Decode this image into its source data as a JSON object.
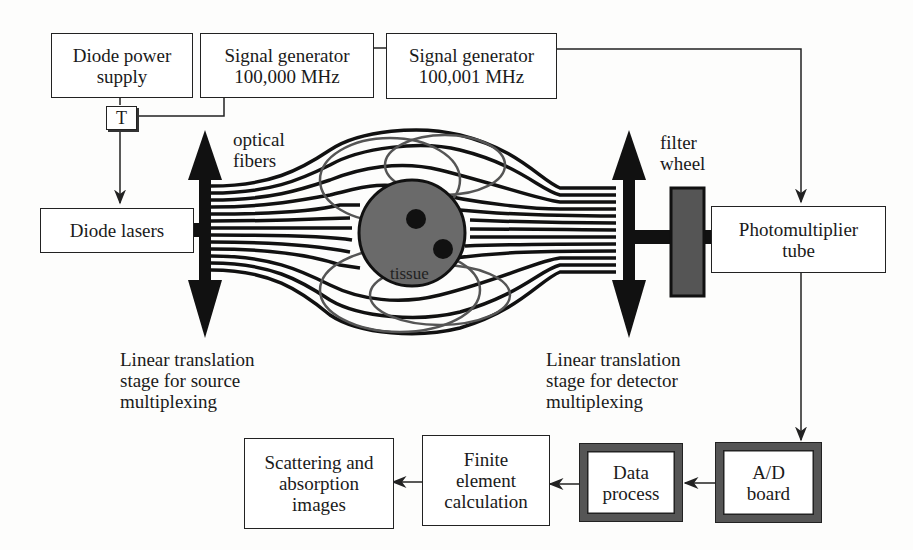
{
  "diagram": {
    "boxes": {
      "diode_power_supply": "Diode power\nsupply",
      "signal_gen_1": "Signal generator\n100,000 MHz",
      "signal_gen_2": "Signal generator\n100,001 MHz",
      "t_box": "T",
      "diode_lasers": "Diode lasers",
      "photomultiplier": "Photomultiplier\ntube",
      "ad_board": "A/D\nboard",
      "data_process": "Data\nprocess",
      "finite_element": "Finite\nelement\ncalculation",
      "scattering_images": "Scattering and\nabsorption\nimages"
    },
    "labels": {
      "optical_fibers": "optical\nfibers",
      "filter_wheel": "filter\nwheel",
      "tissue": "tissue",
      "source_stage": "Linear translation\nstage for source\nmultiplexing",
      "detector_stage": "Linear translation\nstage for detector\nmultiplexing"
    },
    "colors": {
      "line": "#222222",
      "tissue_fill": "#6a6a6a",
      "filter_fill": "#555555",
      "thick_border": "#555555"
    }
  }
}
